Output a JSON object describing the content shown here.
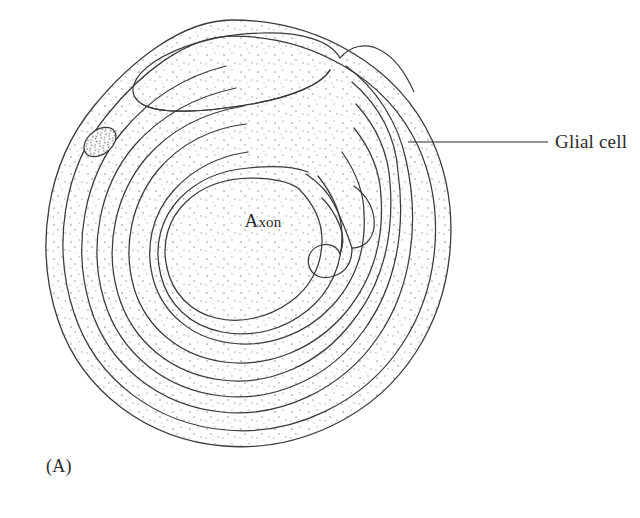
{
  "figure": {
    "panel_label": "(A)",
    "background_color": "#ffffff",
    "line_color": "#3a3a3a",
    "stipple_color": "#8d8d8d",
    "text_color": "#2b2b2b"
  },
  "labels": {
    "axon": "Axon",
    "axon_initial": "A",
    "axon_rest": "xon",
    "glial_cell": "Glial cell"
  },
  "diagram_data": {
    "type": "biological-cross-section",
    "subject": "myelinated axon wrapped by a glial cell",
    "structures": [
      {
        "name": "axon",
        "description": "central unstained circular profile",
        "label": "Axon"
      },
      {
        "name": "glial-cell-outer-membrane",
        "description": "outermost closed boundary of the glial cell",
        "label": "Glial cell"
      },
      {
        "name": "glial-cytoplasm",
        "description": "stippled cytoplasmic band between outer membrane and first myelin lamella"
      },
      {
        "name": "glial-nucleus",
        "description": "densely stippled oval in the upper-left cytoplasm"
      },
      {
        "name": "myelin-lamellae",
        "description": "concentric spiral wraps of glial membrane around the axon",
        "turn_count": 6
      },
      {
        "name": "outer-tongue",
        "description": "elongated cytoplasm-filled loop at the top where the spiral begins"
      },
      {
        "name": "inner-tongue",
        "description": "hooked terminus of the spiral adjacent to the axon on the right"
      }
    ],
    "leader_lines": [
      {
        "from": "glial_cell_label",
        "to": "glial-cytoplasm",
        "x1": 548,
        "y1": 142,
        "x2": 408,
        "y2": 142
      }
    ]
  }
}
